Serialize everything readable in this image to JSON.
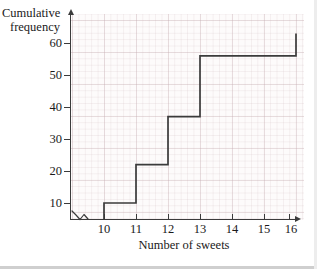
{
  "chart_data": {
    "type": "line",
    "subtype": "cumulative-frequency-step",
    "title": "",
    "xlabel": "Number of sweets",
    "ylabel": "Cumulative frequency",
    "x": [
      10,
      11,
      12,
      13,
      14,
      15,
      16
    ],
    "values": [
      5,
      17,
      32,
      51,
      51,
      51,
      58
    ],
    "series": [
      {
        "name": "Cumulative frequency",
        "values": [
          5,
          17,
          32,
          51,
          51,
          51,
          58
        ]
      }
    ],
    "xlim": [
      9.6,
      16.4
    ],
    "ylim": [
      0,
      64
    ],
    "xticks": [
      10,
      11,
      12,
      13,
      14,
      15,
      16
    ],
    "yticks": [
      10,
      20,
      30,
      40,
      50,
      60
    ],
    "xtick_labels": [
      "10",
      "11",
      "12",
      "13",
      "14",
      "15",
      "16"
    ],
    "ytick_labels": [
      "10",
      "20",
      "30",
      "40",
      "50",
      "60"
    ],
    "grid": true,
    "grid_minor": true,
    "legend": false,
    "axis_break": "x-axis-origin-zigzag",
    "line_color": "#3b3b3b",
    "grid_color": "#c4aaaf",
    "background_color": "#fdfbfb"
  },
  "axes": {
    "y_title_line1": "Cumulative",
    "y_title_line2": "frequency",
    "x_title": "Number of sweets"
  },
  "colors": {
    "ink": "#1a1a1a",
    "line": "#3b3b3b",
    "grid_major": "#c4aaaf",
    "grid_minor": "#ded0d3",
    "paper": "#fdfbfb"
  }
}
